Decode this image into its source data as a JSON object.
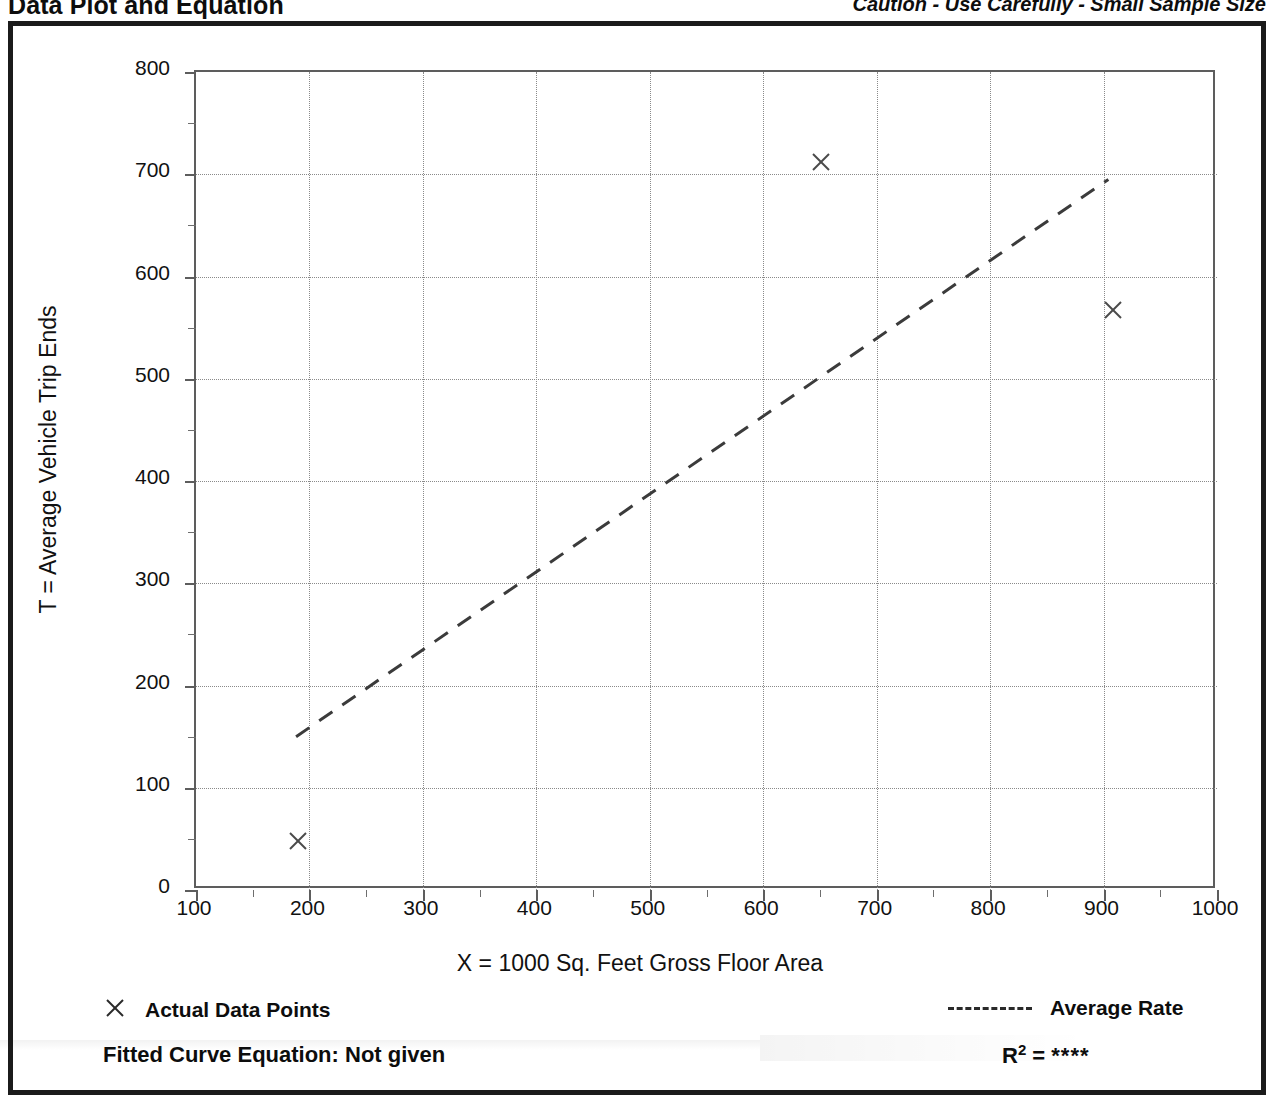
{
  "header": {
    "title": "Data Plot and Equation",
    "caution": "Caution - Use Carefully - Small Sample Size"
  },
  "legend": {
    "data_points_label": "Actual Data Points",
    "data_points_marker": "x-marker-icon",
    "average_rate_label": "Average Rate",
    "average_rate_marker": "dashed-line-icon"
  },
  "footer": {
    "equation_label": "Fitted Curve Equation:  Not given",
    "r2_prefix": "R",
    "r2_exponent": "2",
    "r2_equals": " = ",
    "r2_value": "****"
  },
  "colors": {
    "ink": "#111111",
    "frame": "#1b1b1b",
    "axis": "#5d5d5d",
    "grid": "#8a8a8a"
  },
  "chart_data": {
    "type": "scatter",
    "title": "Data Plot and Equation",
    "xlabel": "X = 1000 Sq. Feet Gross Floor Area",
    "ylabel": "T = Average Vehicle Trip Ends",
    "xlim": [
      100,
      1000
    ],
    "ylim": [
      0,
      800
    ],
    "xticks": [
      100,
      200,
      300,
      400,
      500,
      600,
      700,
      800,
      900,
      1000
    ],
    "yticks": [
      0,
      100,
      200,
      300,
      400,
      500,
      600,
      700,
      800
    ],
    "xtick_labels": [
      "100",
      "200",
      "300",
      "400",
      "500",
      "600",
      "700",
      "800",
      "900",
      "1000"
    ],
    "ytick_labels": [
      "0",
      "100",
      "200",
      "300",
      "400",
      "500",
      "600",
      "700",
      "800"
    ],
    "x_minor_step": 50,
    "y_minor_step": 50,
    "grid": true,
    "legend_position": "below-plot",
    "series": [
      {
        "name": "Actual Data Points",
        "type": "scatter",
        "marker": "x",
        "points": [
          {
            "x": 190,
            "y": 48
          },
          {
            "x": 651,
            "y": 712
          },
          {
            "x": 908,
            "y": 567
          }
        ]
      },
      {
        "name": "Average Rate",
        "type": "line",
        "style": "dashed",
        "points": [
          {
            "x": 190,
            "y": 148
          },
          {
            "x": 906,
            "y": 693
          }
        ]
      }
    ],
    "annotations": [
      {
        "text": "Fitted Curve Equation:  Not given"
      },
      {
        "text": "R2 = ****"
      },
      {
        "text": "Caution - Use Carefully - Small Sample Size"
      }
    ]
  }
}
